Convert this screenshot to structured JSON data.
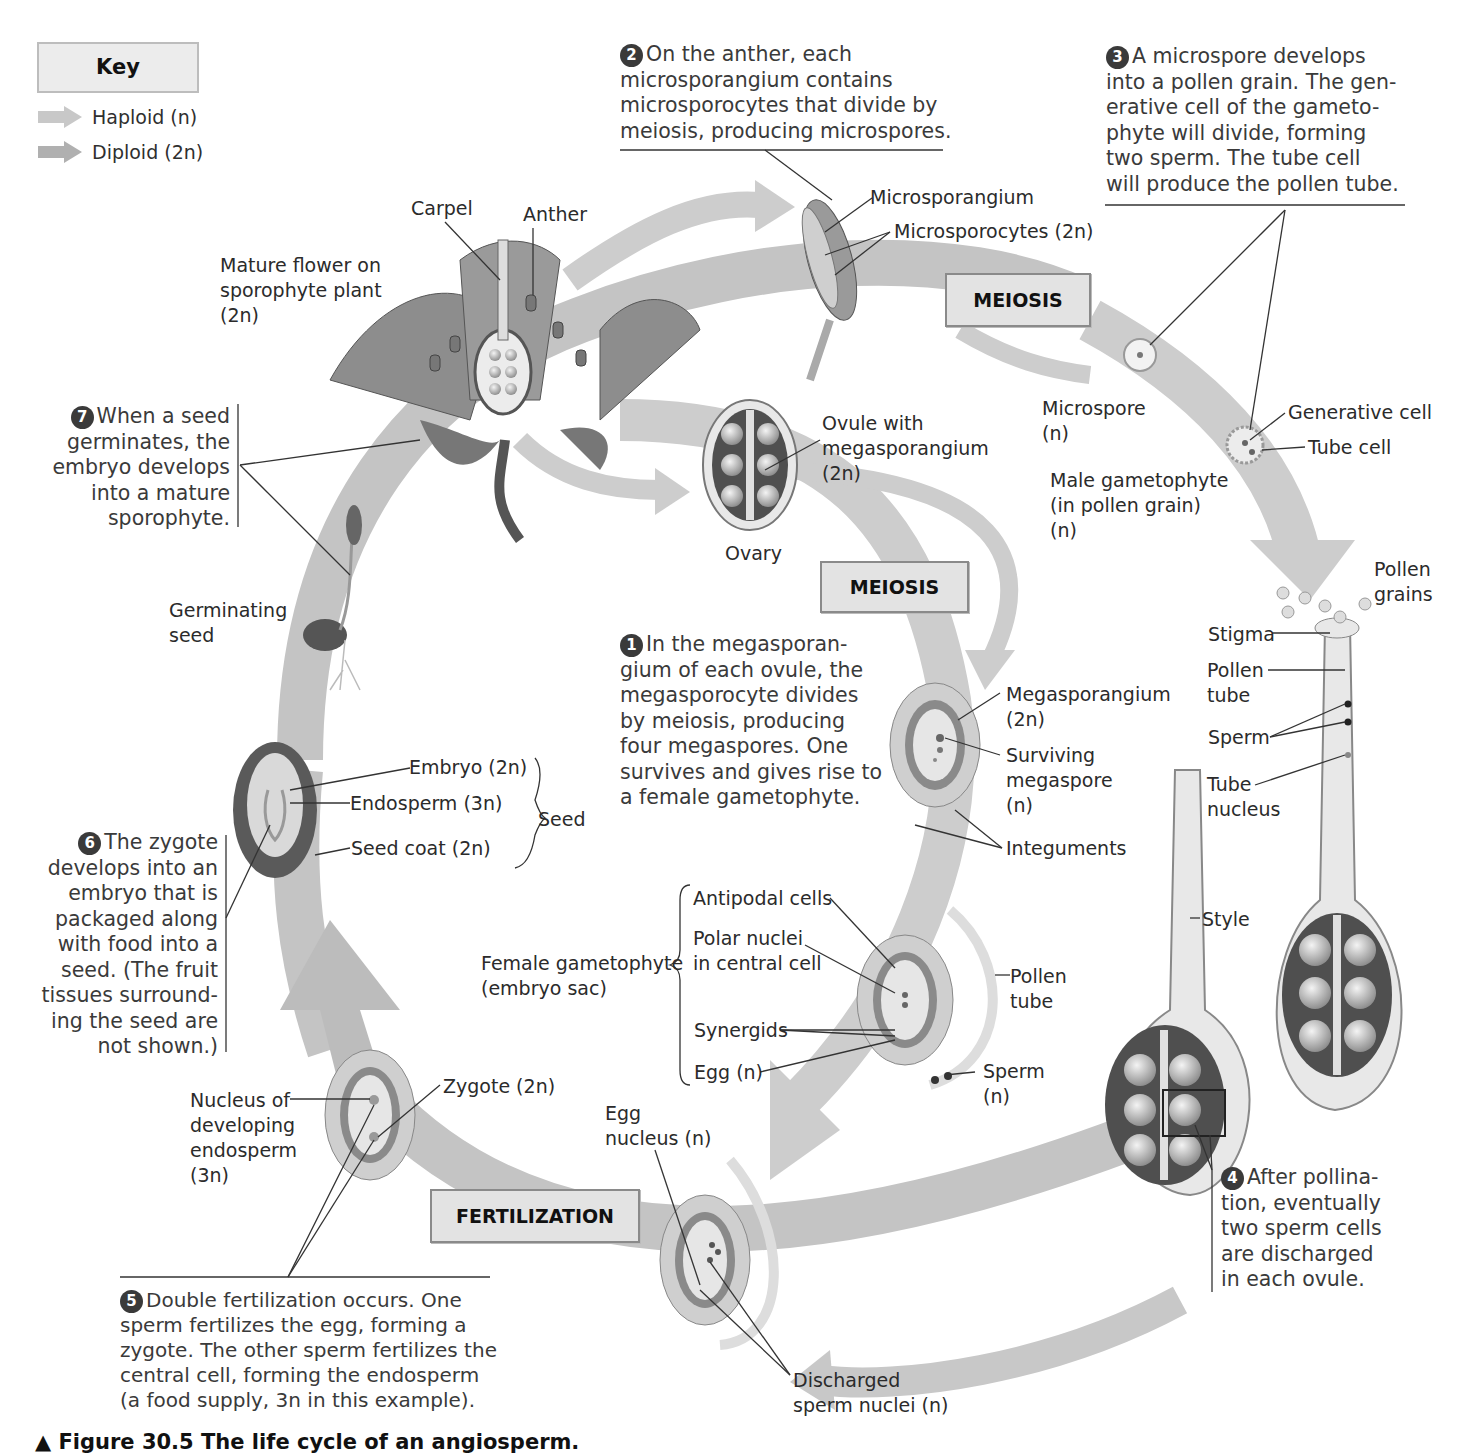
{
  "key": {
    "title": "Key",
    "items": [
      {
        "label": "Haploid (n)",
        "arrow_color": "#c8c8c8"
      },
      {
        "label": "Diploid (2n)",
        "arrow_color": "#b0b0b0"
      }
    ]
  },
  "phases": {
    "meiosis_top": "MEIOSIS",
    "meiosis_mid": "MEIOSIS",
    "fertilization": "FERTILIZATION"
  },
  "steps": [
    {
      "num": "1",
      "text": "In the megasporan-\ngium of each ovule, the\nmegasporocyte divides\nby meiosis, producing\nfour megaspores. One\nsurvives and gives rise to\na female gametophyte."
    },
    {
      "num": "2",
      "text": "On the anther, each\nmicrosporangium contains\nmicrosporocytes that divide by\nmeiosis, producing microspores."
    },
    {
      "num": "3",
      "text": "A microspore develops\ninto a pollen grain. The gen-\nerative cell of the gameto-\nphyte will divide, forming\ntwo sperm. The tube cell\nwill produce the pollen tube."
    },
    {
      "num": "4",
      "text": "After pollina-\ntion, eventually\ntwo sperm cells\nare discharged\nin each ovule."
    },
    {
      "num": "5",
      "text": "Double fertilization occurs. One\nsperm fertilizes the egg, forming a\nzygote. The other sperm fertilizes the\ncentral cell, forming the endosperm\n(a food supply, 3n in this example)."
    },
    {
      "num": "6",
      "text": "The zygote\ndevelops into an\nembryo that is\npackaged along\nwith food into a\nseed. (The fruit\ntissues surround-\ning the seed are\nnot shown.)"
    },
    {
      "num": "7",
      "text": "When a seed\ngerminates, the\nembryo develops\ninto a mature\nsporophyte."
    }
  ],
  "labels": {
    "carpel": "Carpel",
    "anther": "Anther",
    "mature_flower": "Mature flower on\nsporophyte plant\n(2n)",
    "microsporangium": "Microsporangium",
    "microsporocytes": "Microsporocytes (2n)",
    "microspore": "Microspore\n(n)",
    "generative_cell": "Generative cell",
    "tube_cell": "Tube cell",
    "male_gametophyte": "Male gametophyte\n(in pollen grain)\n(n)",
    "pollen_grains": "Pollen\ngrains",
    "stigma": "Stigma",
    "pollen_tube_right": "Pollen\ntube",
    "sperm_right": "Sperm",
    "tube_nucleus": "Tube\nnucleus",
    "style": "Style",
    "ovule_with_megasporangium": "Ovule with\nmegasporangium\n(2n)",
    "ovary": "Ovary",
    "megasporangium": "Megasporangium\n(2n)",
    "surviving_megaspore": "Surviving\nmegaspore\n(n)",
    "integuments": "Integuments",
    "antipodal_cells": "Antipodal cells",
    "polar_nuclei": "Polar nuclei\nin central cell",
    "female_gametophyte": "Female gametophyte\n(embryo sac)",
    "synergids": "Synergids",
    "egg": "Egg (n)",
    "pollen_tube_mid": "Pollen\ntube",
    "sperm_mid": "Sperm\n(n)",
    "egg_nucleus": "Egg\nnucleus (n)",
    "discharged_sperm": "Discharged\nsperm nuclei (n)",
    "nucleus_endosperm": "Nucleus of\ndeveloping\nendosperm\n(3n)",
    "zygote": "Zygote (2n)",
    "embryo": "Embryo (2n)",
    "endosperm": "Endosperm (3n)",
    "seed_coat": "Seed coat (2n)",
    "seed": "Seed",
    "germinating_seed": "Germinating\nseed"
  },
  "caption": "▲ Figure 30.5 The life cycle of an angiosperm.",
  "colors": {
    "haploid_arrow": "#c8c8c8",
    "diploid_arrow": "#b0b0b0",
    "tissue_dark": "#555555",
    "tissue_mid": "#8c8c8c",
    "tissue_light": "#d6d6d6"
  }
}
